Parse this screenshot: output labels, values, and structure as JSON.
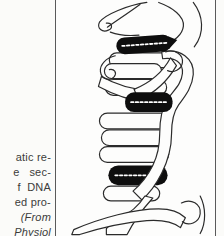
{
  "caption": {
    "lines": [
      {
        "text": "atic re-"
      },
      {
        "text": "e   sec-"
      },
      {
        "text": "f  DNA"
      },
      {
        "text": "ed pro-"
      },
      {
        "text": "(From"
      },
      {
        "text": "Physiol"
      }
    ]
  },
  "figure": {
    "base_pair_bar_count": 3,
    "colors": {
      "ink": "#2b2b2b",
      "base_pair_bar": "#0e0e0e",
      "paper": "#fdfdfc",
      "rule": "#5a5a5a"
    }
  }
}
